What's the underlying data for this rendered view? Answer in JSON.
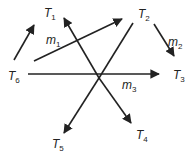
{
  "diagram": {
    "nodes": [
      {
        "id": "T1",
        "base": "T",
        "sub": "1",
        "x": 44,
        "y": 17
      },
      {
        "id": "T2",
        "base": "T",
        "sub": "2",
        "x": 138,
        "y": 18
      },
      {
        "id": "T3",
        "base": "T",
        "sub": "3",
        "x": 173,
        "y": 79
      },
      {
        "id": "T4",
        "base": "T",
        "sub": "4",
        "x": 136,
        "y": 139
      },
      {
        "id": "T5",
        "base": "T",
        "sub": "5",
        "x": 52,
        "y": 148
      },
      {
        "id": "T6",
        "base": "T",
        "sub": "6",
        "x": 8,
        "y": 80
      }
    ],
    "edge_labels": [
      {
        "id": "m1",
        "base": "m",
        "sub": "1",
        "x": 46,
        "y": 44
      },
      {
        "id": "m2",
        "base": "m",
        "sub": "2",
        "x": 168,
        "y": 46
      },
      {
        "id": "m3",
        "base": "m",
        "sub": "3",
        "x": 122,
        "y": 89
      }
    ],
    "arrows": [
      {
        "name": "arrow-to-t1-left",
        "x1": 14,
        "y1": 60,
        "x2": 34,
        "y2": 25
      },
      {
        "name": "arrow-m1-to-t2",
        "x1": 34,
        "y1": 61,
        "x2": 122,
        "y2": 19
      },
      {
        "name": "arrow-to-t1-right",
        "x1": 99,
        "y1": 78,
        "x2": 64,
        "y2": 18
      },
      {
        "name": "arrow-m2",
        "x1": 154,
        "y1": 24,
        "x2": 174,
        "y2": 56
      },
      {
        "name": "arrow-t6-to-t3",
        "x1": 28,
        "y1": 74,
        "x2": 159,
        "y2": 74
      },
      {
        "name": "arrow-to-t4",
        "x1": 99,
        "y1": 78,
        "x2": 131,
        "y2": 123
      },
      {
        "name": "arrow-to-t5",
        "x1": 99,
        "y1": 78,
        "x2": 64,
        "y2": 133
      },
      {
        "name": "line-t2-to-center",
        "x1": 133,
        "y1": 23,
        "x2": 99,
        "y2": 78
      }
    ]
  }
}
